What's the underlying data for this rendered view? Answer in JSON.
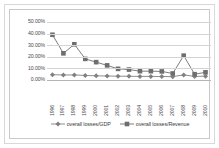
{
  "chart_data": {
    "type": "line",
    "title": "",
    "xlabel": "",
    "ylabel": "",
    "categories": [
      "1996",
      "1997",
      "1998",
      "1999",
      "2000",
      "2001",
      "2002",
      "2003",
      "2004",
      "2005",
      "2006",
      "2007",
      "2008",
      "2009",
      "2010"
    ],
    "ylim": [
      0,
      50
    ],
    "ytick_labels": [
      "0.00%",
      "10.00%",
      "20.00%",
      "30.00%",
      "40.00%",
      "50.00%"
    ],
    "ytick_values": [
      0,
      10,
      20,
      30,
      40,
      50
    ],
    "grid": true,
    "legend_position": "bottom",
    "series": [
      {
        "name": "overall losses/GDP",
        "marker": "diamond",
        "color": "#808080",
        "values": [
          4.6,
          4.3,
          4.4,
          3.9,
          3.6,
          3.4,
          3.3,
          3.2,
          3.1,
          3.1,
          3.0,
          2.9,
          4.4,
          3.1,
          3.3
        ]
      },
      {
        "name": "overall losses/Revenue",
        "marker": "square",
        "color": "#6e6e6e",
        "values": [
          39.0,
          23.0,
          30.8,
          18.2,
          15.4,
          12.6,
          9.6,
          9.0,
          7.6,
          7.6,
          7.4,
          5.6,
          21.0,
          5.0,
          6.6
        ]
      }
    ]
  },
  "legend": {
    "items": [
      {
        "label": "overall losses/GDP"
      },
      {
        "label": "overall losses/Revenue"
      }
    ]
  }
}
